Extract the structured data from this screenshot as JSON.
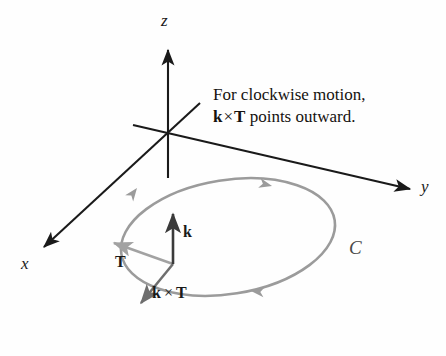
{
  "figure": {
    "title_text": "For clockwise motion, k x T points outward.",
    "background_color": "#fefefe",
    "caption": {
      "line1": "For clockwise motion,",
      "line2_vector1": "k",
      "line2_times": "×",
      "line2_vector2": "T",
      "line2_rest": "points outward."
    },
    "axes": [
      {
        "name": "z-axis",
        "label": "z",
        "color": "#1a1a1a",
        "origin": [
          168,
          133
        ],
        "tip": [
          168,
          46
        ],
        "label_pos": [
          162,
          18
        ]
      },
      {
        "name": "y-axis",
        "label": "y",
        "color": "#1a1a1a",
        "origin": [
          168,
          133
        ],
        "tip": [
          414,
          190
        ],
        "label_pos": [
          421,
          181
        ]
      },
      {
        "name": "x-axis",
        "label": "x",
        "color": "#1a1a1a",
        "origin": [
          168,
          133
        ],
        "tip": [
          40,
          251
        ],
        "label_pos": [
          22,
          256
        ]
      }
    ],
    "origin_point": [
      168,
      133
    ],
    "curve": {
      "name": "curve-C",
      "label": "C",
      "label_pos": [
        350,
        243
      ],
      "color": "#9b9b9b",
      "center": [
        228,
        237
      ],
      "radius_x": 108,
      "radius_y": 57,
      "rotation_deg": -9,
      "direction": "clockwise",
      "arrow_count": 3
    },
    "vectors": [
      {
        "name": "k-vector",
        "label": "k",
        "color": "#3a3a3a",
        "from": [
          173,
          264
        ],
        "to": [
          173,
          210
        ],
        "label_pos": [
          183,
          229
        ]
      },
      {
        "name": "T-vector",
        "label": "T",
        "color": "#a2a2a2",
        "from": [
          173,
          264
        ],
        "to": [
          110,
          241
        ],
        "label_pos": [
          116,
          259
        ]
      },
      {
        "name": "k-cross-T-vector",
        "label_vector1": "k",
        "label_times": "×",
        "label_vector2": "T",
        "color": "#6e6e6e",
        "from": [
          173,
          264
        ],
        "to": [
          138,
          307
        ],
        "label_pos": [
          152,
          289
        ]
      }
    ]
  }
}
